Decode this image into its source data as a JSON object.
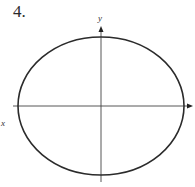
{
  "problem": {
    "number_label": "4."
  },
  "axes": {
    "x_label": "x",
    "y_label": "y"
  },
  "figure": {
    "shape": "ellipse",
    "center": [
      101,
      106
    ],
    "rx": 83,
    "ry": 69,
    "stroke_color": "#2b2b2b",
    "axis_color": "#444444"
  }
}
